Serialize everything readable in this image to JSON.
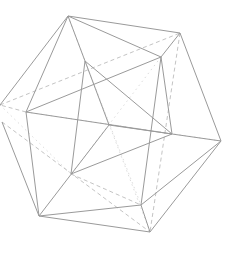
{
  "diagram": {
    "title": "",
    "shape": "icosahedron-wireframe",
    "colors": {
      "background": "#ffffff",
      "solid_edge": "#9a9a9a",
      "dashed_edge": "#c4c4c4",
      "dotted_edge": "#dcdcdc"
    },
    "vertices": {
      "A": [
        68,
        16
      ],
      "B": [
        180,
        33
      ],
      "C": [
        161,
        57
      ],
      "D": [
        85,
        61
      ],
      "E": [
        26,
        112
      ],
      "F": [
        0,
        105
      ],
      "F2": [
        2,
        122
      ],
      "G": [
        109,
        125
      ],
      "I": [
        172,
        134
      ],
      "H": [
        221,
        141
      ],
      "J": [
        71,
        174
      ],
      "K": [
        39,
        216
      ],
      "L": [
        141,
        205
      ],
      "M": [
        150,
        232
      ]
    },
    "solid_edges": [
      [
        "A",
        "B"
      ],
      [
        "A",
        "F"
      ],
      [
        "A",
        "E"
      ],
      [
        "A",
        "D"
      ],
      [
        "A",
        "C"
      ],
      [
        "B",
        "C"
      ],
      [
        "B",
        "H"
      ],
      [
        "C",
        "E"
      ],
      [
        "C",
        "I"
      ],
      [
        "C",
        "L"
      ],
      [
        "D",
        "G"
      ],
      [
        "D",
        "I"
      ],
      [
        "D",
        "J"
      ],
      [
        "E",
        "K"
      ],
      [
        "E",
        "I"
      ],
      [
        "F2",
        "K"
      ],
      [
        "G",
        "I"
      ],
      [
        "G",
        "K"
      ],
      [
        "I",
        "H"
      ],
      [
        "I",
        "J"
      ],
      [
        "H",
        "L"
      ],
      [
        "H",
        "M"
      ],
      [
        "K",
        "L"
      ],
      [
        "K",
        "M"
      ],
      [
        "L",
        "M"
      ]
    ],
    "dashed_edges": [
      [
        "F",
        "B"
      ],
      [
        "F2",
        "M"
      ],
      [
        "B",
        "M"
      ],
      [
        "E",
        "F"
      ],
      [
        "J",
        "L"
      ]
    ],
    "dotted_edges": [
      [
        "D",
        "L"
      ],
      [
        "F",
        "J"
      ],
      [
        "C",
        "J"
      ],
      [
        "E",
        "H"
      ],
      [
        "A",
        "M"
      ]
    ]
  }
}
